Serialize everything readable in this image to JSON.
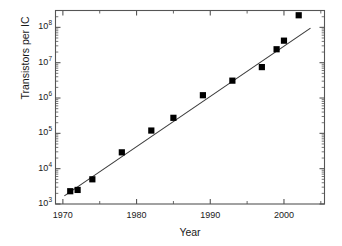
{
  "chart_data": {
    "type": "scatter",
    "title": "",
    "xlabel": "Year",
    "ylabel": "Transistors per IC",
    "xlim": [
      1969,
      2005.5
    ],
    "ylim": [
      1000,
      300000000
    ],
    "yscale": "log",
    "grid": false,
    "legend": null,
    "x": [
      1971,
      1972,
      1974,
      1978,
      1982,
      1985,
      1989,
      1993,
      1997,
      1999,
      2000,
      2002
    ],
    "values": [
      2300,
      2500,
      5000,
      29000,
      120000,
      275000,
      1200000,
      3100000,
      7500000,
      24000000,
      42000000,
      220000000
    ],
    "series": [
      {
        "name": "Transistors per IC",
        "marker": "square",
        "color": "#000000",
        "x": [
          1971,
          1972,
          1974,
          1978,
          1982,
          1985,
          1989,
          1993,
          1997,
          1999,
          2000,
          2002
        ],
        "values": [
          2300,
          2500,
          5000,
          29000,
          120000,
          275000,
          1200000,
          3100000,
          7500000,
          24000000,
          42000000,
          220000000
        ]
      },
      {
        "name": "fit-line",
        "type": "line",
        "color": "#3a3a3a",
        "x": [
          1970.2,
          2003.6
        ],
        "values": [
          1700,
          95000000
        ]
      }
    ],
    "xticks": [
      1970,
      1980,
      1990,
      2000
    ],
    "xticklabels": [
      "1970",
      "1980",
      "1990",
      "2000"
    ],
    "xminorticks": [
      1975,
      1985,
      1995,
      2005
    ],
    "yticks": [
      1000,
      10000,
      100000,
      1000000,
      10000000,
      100000000
    ],
    "yticklabels": [
      "10³",
      "10⁴",
      "10⁵",
      "10⁶",
      "10⁷",
      "10⁸"
    ]
  },
  "axes": {
    "y": {
      "labels": [
        {
          "base": "10",
          "exp": "8"
        },
        {
          "base": "10",
          "exp": "7"
        },
        {
          "base": "10",
          "exp": "6"
        },
        {
          "base": "10",
          "exp": "5"
        },
        {
          "base": "10",
          "exp": "4"
        },
        {
          "base": "10",
          "exp": "3"
        }
      ],
      "title": "Transistors per IC"
    },
    "x": {
      "labels": [
        "1970",
        "1980",
        "1990",
        "2000"
      ],
      "title": "Year"
    }
  },
  "colors": {
    "marker": "#000000",
    "line": "#3a3a3a",
    "frame": "#555555",
    "text": "#1a1a1a",
    "background": "#ffffff"
  }
}
